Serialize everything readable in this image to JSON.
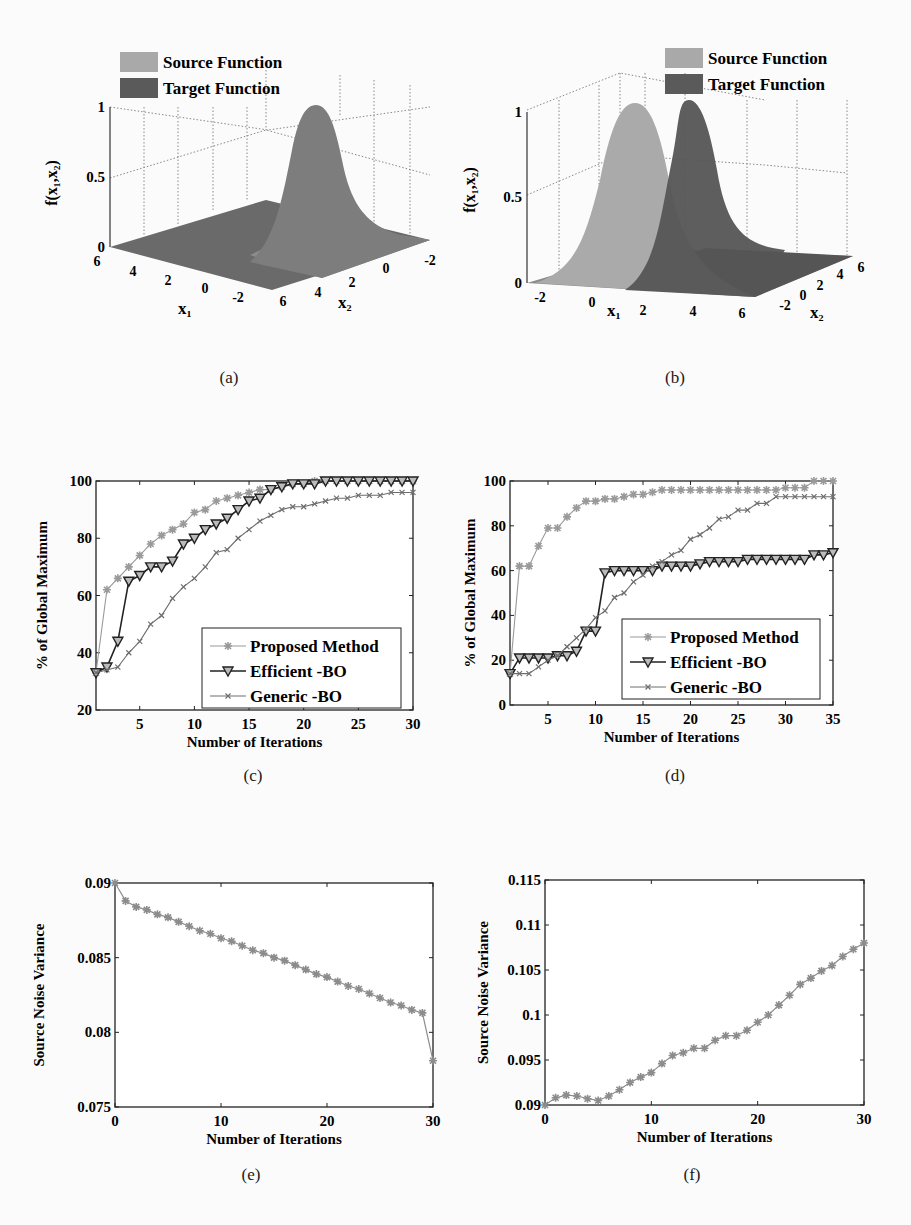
{
  "figure": {
    "captions": [
      "(a)",
      "(b)",
      "(c)",
      "(d)",
      "(e)",
      "(f)"
    ]
  },
  "legend_3d": {
    "source": "Source Function",
    "target": "Target Function",
    "source_color": "#a9a9a9",
    "target_color": "#5a5a5a"
  },
  "legend_2d": {
    "proposed": "Proposed Method",
    "efficient": "Efficient -BO",
    "generic": "Generic -BO",
    "proposed_color": "#9a9a9a",
    "efficient_color": "#222222",
    "generic_color": "#6e6e6e"
  },
  "chart_data": [
    {
      "id": "a",
      "type": "surface",
      "title": "",
      "xlabel": "x1",
      "ylabel": "x2",
      "zlabel": "f(x1,x2)",
      "x_ticks": [
        "6",
        "4",
        "2",
        "0",
        "-2"
      ],
      "y_ticks": [
        "6",
        "4",
        "2",
        "0",
        "-2"
      ],
      "z_ticks": [
        "0",
        "0.5",
        "1"
      ],
      "zlim": [
        0,
        1
      ],
      "legend": [
        "Source Function",
        "Target Function"
      ],
      "series": [
        {
          "name": "Source Function",
          "peak": [
            2,
            0
          ],
          "peak_value": 1
        },
        {
          "name": "Target Function",
          "peak": [
            2,
            0
          ],
          "peak_value": 1
        }
      ]
    },
    {
      "id": "b",
      "type": "surface",
      "xlabel": "x1",
      "ylabel": "x2",
      "zlabel": "f(x1,x2)",
      "x_ticks": [
        "-2",
        "0",
        "2",
        "4",
        "6"
      ],
      "y_ticks": [
        "-2",
        "0",
        "2",
        "4",
        "6"
      ],
      "z_ticks": [
        "0",
        "0.5",
        "1"
      ],
      "zlim": [
        0,
        1
      ],
      "legend": [
        "Source Function",
        "Target Function"
      ],
      "series": [
        {
          "name": "Source Function",
          "peak": [
            2,
            2
          ],
          "peak_value": 1
        },
        {
          "name": "Target Function",
          "peak": [
            4,
            2
          ],
          "peak_value": 1
        }
      ]
    },
    {
      "id": "c",
      "type": "line",
      "xlabel": "Number of Iterations",
      "ylabel": "% of Global Maximum",
      "xlim": [
        1,
        30
      ],
      "ylim": [
        20,
        100
      ],
      "x_ticks": [
        5,
        10,
        15,
        20,
        25,
        30
      ],
      "y_ticks": [
        20,
        40,
        60,
        80,
        100
      ],
      "legend_position": "lower right",
      "x": [
        1,
        2,
        3,
        4,
        5,
        6,
        7,
        8,
        9,
        10,
        11,
        12,
        13,
        14,
        15,
        16,
        17,
        18,
        19,
        20,
        21,
        22,
        23,
        24,
        25,
        26,
        27,
        28,
        29,
        30
      ],
      "series": [
        {
          "name": "Proposed Method",
          "marker": "star",
          "values": [
            33,
            62,
            66,
            70,
            74,
            78,
            81,
            83,
            85,
            89,
            90,
            93,
            94,
            95,
            96,
            97,
            97,
            98,
            99,
            99,
            100,
            100,
            100,
            100,
            100,
            100,
            100,
            100,
            100,
            100
          ]
        },
        {
          "name": "Efficient -BO",
          "marker": "triangle-down",
          "values": [
            33,
            35,
            44,
            65,
            67,
            70,
            70,
            72,
            78,
            80,
            83,
            85,
            87,
            90,
            93,
            94,
            97,
            98,
            99,
            99,
            99,
            100,
            100,
            100,
            100,
            100,
            100,
            100,
            100,
            100
          ]
        },
        {
          "name": "Generic -BO",
          "marker": "x",
          "values": [
            33,
            34,
            35,
            40,
            44,
            50,
            53,
            59,
            63,
            66,
            70,
            75,
            76,
            80,
            83,
            86,
            88,
            90,
            91,
            91,
            92,
            93,
            94,
            94,
            95,
            95,
            95,
            96,
            96,
            96
          ]
        }
      ]
    },
    {
      "id": "d",
      "type": "line",
      "xlabel": "Number of Iterations",
      "ylabel": "% of Global Maximum",
      "xlim": [
        1,
        35
      ],
      "ylim": [
        0,
        100
      ],
      "x_ticks": [
        5,
        10,
        15,
        20,
        25,
        30,
        35
      ],
      "y_ticks": [
        0,
        20,
        40,
        60,
        80,
        100
      ],
      "legend_position": "lower right",
      "x": [
        1,
        2,
        3,
        4,
        5,
        6,
        7,
        8,
        9,
        10,
        11,
        12,
        13,
        14,
        15,
        16,
        17,
        18,
        19,
        20,
        21,
        22,
        23,
        24,
        25,
        26,
        27,
        28,
        29,
        30,
        31,
        32,
        33,
        34,
        35
      ],
      "series": [
        {
          "name": "Proposed Method",
          "marker": "star",
          "values": [
            14,
            62,
            62,
            71,
            79,
            79,
            84,
            88,
            91,
            91,
            92,
            92,
            93,
            94,
            94,
            95,
            96,
            96,
            96,
            96,
            96,
            96,
            96,
            96,
            96,
            96,
            96,
            96,
            96,
            97,
            97,
            97,
            100,
            100,
            100
          ]
        },
        {
          "name": "Efficient -BO",
          "marker": "triangle-down",
          "values": [
            14,
            21,
            21,
            21,
            21,
            22,
            22,
            24,
            33,
            33,
            59,
            60,
            60,
            60,
            60,
            60,
            62,
            62,
            62,
            62,
            63,
            64,
            64,
            64,
            64,
            65,
            65,
            65,
            65,
            65,
            65,
            65,
            67,
            67,
            68
          ]
        },
        {
          "name": "Generic -BO",
          "marker": "x",
          "values": [
            14,
            14,
            14,
            17,
            20,
            22,
            26,
            30,
            34,
            39,
            42,
            48,
            50,
            55,
            58,
            62,
            64,
            67,
            69,
            74,
            76,
            79,
            83,
            84,
            87,
            87,
            90,
            90,
            93,
            93,
            93,
            93,
            93,
            93,
            93
          ]
        }
      ]
    },
    {
      "id": "e",
      "type": "line",
      "xlabel": "Number of Iterations",
      "ylabel": "Source Noise Variance",
      "xlim": [
        0,
        30
      ],
      "ylim": [
        0.075,
        0.09
      ],
      "x_ticks": [
        0,
        10,
        20,
        30
      ],
      "y_ticks": [
        0.075,
        0.08,
        0.085,
        0.09
      ],
      "x": [
        0,
        1,
        2,
        3,
        4,
        5,
        6,
        7,
        8,
        9,
        10,
        11,
        12,
        13,
        14,
        15,
        16,
        17,
        18,
        19,
        20,
        21,
        22,
        23,
        24,
        25,
        26,
        27,
        28,
        29,
        30
      ],
      "series": [
        {
          "name": "Source Noise Variance",
          "marker": "star",
          "values": [
            0.09,
            0.0888,
            0.0884,
            0.0882,
            0.0879,
            0.0877,
            0.0874,
            0.0871,
            0.0868,
            0.0866,
            0.0863,
            0.0861,
            0.0858,
            0.0855,
            0.0853,
            0.085,
            0.0848,
            0.0845,
            0.0842,
            0.0839,
            0.0837,
            0.0834,
            0.0831,
            0.0829,
            0.0826,
            0.0823,
            0.082,
            0.0818,
            0.0815,
            0.0813,
            0.0781
          ]
        }
      ]
    },
    {
      "id": "f",
      "type": "line",
      "xlabel": "Number of Iterations",
      "ylabel": "Source Noise Variance",
      "xlim": [
        0,
        30
      ],
      "ylim": [
        0.09,
        0.115
      ],
      "x_ticks": [
        0,
        10,
        20,
        30
      ],
      "y_ticks": [
        0.09,
        0.095,
        0.1,
        0.105,
        0.11,
        0.115
      ],
      "x": [
        0,
        1,
        2,
        3,
        4,
        5,
        6,
        7,
        8,
        9,
        10,
        11,
        12,
        13,
        14,
        15,
        16,
        17,
        18,
        19,
        20,
        21,
        22,
        23,
        24,
        25,
        26,
        27,
        28,
        29,
        30
      ],
      "series": [
        {
          "name": "Source Noise Variance",
          "marker": "star",
          "values": [
            0.09,
            0.0908,
            0.0911,
            0.091,
            0.0907,
            0.0905,
            0.091,
            0.0917,
            0.0925,
            0.0931,
            0.0936,
            0.0946,
            0.0955,
            0.0958,
            0.0963,
            0.0963,
            0.0972,
            0.0977,
            0.0977,
            0.0983,
            0.0992,
            0.1,
            0.1011,
            0.1022,
            0.1034,
            0.1041,
            0.1049,
            0.1055,
            0.1065,
            0.1073,
            0.108
          ]
        }
      ]
    }
  ]
}
